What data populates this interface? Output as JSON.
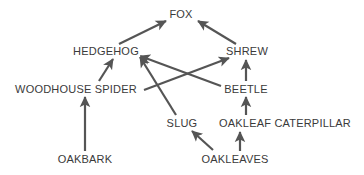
{
  "diagram": {
    "type": "food-web",
    "stroke_color": "#555555",
    "text_color": "#3a3a3a",
    "background_color": "#ffffff",
    "nodes": [
      {
        "id": "fox",
        "label": "FOX",
        "x": 181,
        "y": 14
      },
      {
        "id": "hedgehog",
        "label": "HEDGEHOG",
        "x": 106,
        "y": 51
      },
      {
        "id": "shrew",
        "label": "SHREW",
        "x": 247,
        "y": 51
      },
      {
        "id": "spider",
        "label": "WOODHOUSE SPIDER",
        "x": 76,
        "y": 89
      },
      {
        "id": "beetle",
        "label": "BEETLE",
        "x": 246,
        "y": 89
      },
      {
        "id": "slug",
        "label": "SLUG",
        "x": 182,
        "y": 123
      },
      {
        "id": "caterpillar",
        "label": "OAKLEAF CATERPILLAR",
        "x": 285,
        "y": 123
      },
      {
        "id": "oakbark",
        "label": "OAKBARK",
        "x": 85,
        "y": 159
      },
      {
        "id": "oakleaves",
        "label": "OAKLEAVES",
        "x": 235,
        "y": 159
      }
    ],
    "edges": [
      {
        "from": "hedgehog",
        "to": "fox",
        "x1": 119,
        "y1": 44,
        "x2": 166,
        "y2": 21
      },
      {
        "from": "shrew",
        "to": "fox",
        "x1": 236,
        "y1": 44,
        "x2": 198,
        "y2": 21
      },
      {
        "from": "spider",
        "to": "hedgehog",
        "x1": 99,
        "y1": 81,
        "x2": 113,
        "y2": 59
      },
      {
        "from": "slug",
        "to": "hedgehog",
        "x1": 176,
        "y1": 115,
        "x2": 140,
        "y2": 57
      },
      {
        "from": "beetle",
        "to": "hedgehog",
        "x1": 221,
        "y1": 86,
        "x2": 140,
        "y2": 56
      },
      {
        "from": "spider",
        "to": "shrew",
        "x1": 144,
        "y1": 90,
        "x2": 229,
        "y2": 58
      },
      {
        "from": "beetle",
        "to": "shrew",
        "x1": 246,
        "y1": 81,
        "x2": 246,
        "y2": 60
      },
      {
        "from": "caterpillar",
        "to": "beetle",
        "x1": 246,
        "y1": 115,
        "x2": 246,
        "y2": 97
      },
      {
        "from": "oakleaves",
        "to": "caterpillar",
        "x1": 240,
        "y1": 151,
        "x2": 240,
        "y2": 132
      },
      {
        "from": "oakleaves",
        "to": "slug",
        "x1": 213,
        "y1": 150,
        "x2": 192,
        "y2": 131
      },
      {
        "from": "oakbark",
        "to": "spider",
        "x1": 85,
        "y1": 151,
        "x2": 85,
        "y2": 97
      }
    ]
  }
}
